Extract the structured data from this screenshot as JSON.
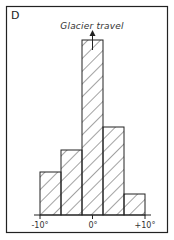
{
  "panel": {
    "label": "D"
  },
  "chart_data": {
    "type": "bar",
    "title": "Glacier travel",
    "xlabel": "",
    "ylabel": "",
    "bins": [
      [
        -10,
        -6
      ],
      [
        -6,
        -2
      ],
      [
        -2,
        2
      ],
      [
        2,
        6
      ],
      [
        6,
        10
      ]
    ],
    "categories": [
      "-10° to -6°",
      "-6° to -2°",
      "-2° to +2°",
      "+2° to +6°",
      "+6° to +10°"
    ],
    "values": [
      43,
      65,
      175,
      88,
      21
    ],
    "xlim": [
      -10,
      10
    ],
    "xtick_labels": [
      "-10°",
      "0°",
      "+10°"
    ],
    "annotations": [
      "Arrow pointing up from central bar labelled 'Glacier travel'"
    ],
    "grid": false,
    "fill": "diagonal hatching"
  },
  "colors": {
    "line": "#222222",
    "background": "#ffffff"
  }
}
